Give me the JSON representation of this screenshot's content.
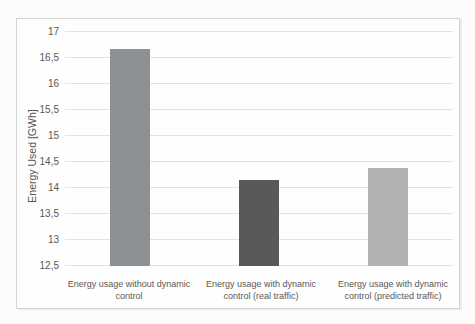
{
  "chart_data": {
    "type": "bar",
    "title": "",
    "categories": [
      "Energy usage without dynamic control",
      "Energy usage with dynamic control (real traffic)",
      "Energy usage with dynamic control (predicted traffic)"
    ],
    "values": [
      16.68,
      14.15,
      14.38
    ],
    "bar_colors": [
      "#8d9193",
      "#58595a",
      "#b1b3b0"
    ],
    "xlabel": "",
    "ylabel": "Energy Used [GWh]",
    "ylim": [
      12.5,
      17
    ],
    "ytick_step": 0.5,
    "ytick_labels": [
      "12,5",
      "13",
      "13,5",
      "14",
      "14,5",
      "15",
      "15,5",
      "16",
      "16,5",
      "17"
    ],
    "grid": true,
    "legend_position": "none",
    "decimal_separator": ","
  },
  "style": {
    "text_color": "#595959",
    "gridline_color": "#e3e3e1",
    "frame_border_color": "#d4d4d2",
    "page_background": "#fcfcfb"
  }
}
